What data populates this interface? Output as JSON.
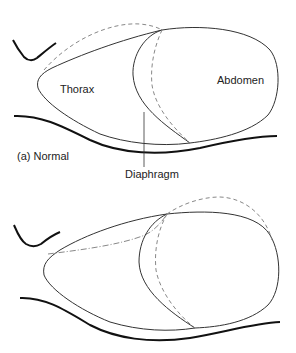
{
  "figure_a": {
    "caption": "(a) Normal",
    "labels": {
      "thorax": "Thorax",
      "abdomen": "Abdomen",
      "diaphragm": "Diaphragm"
    }
  },
  "figure_b": {
    "caption": "",
    "labels": {}
  },
  "colors": {
    "stroke": "#333333",
    "dashed": "#888888",
    "back": "#111111"
  }
}
